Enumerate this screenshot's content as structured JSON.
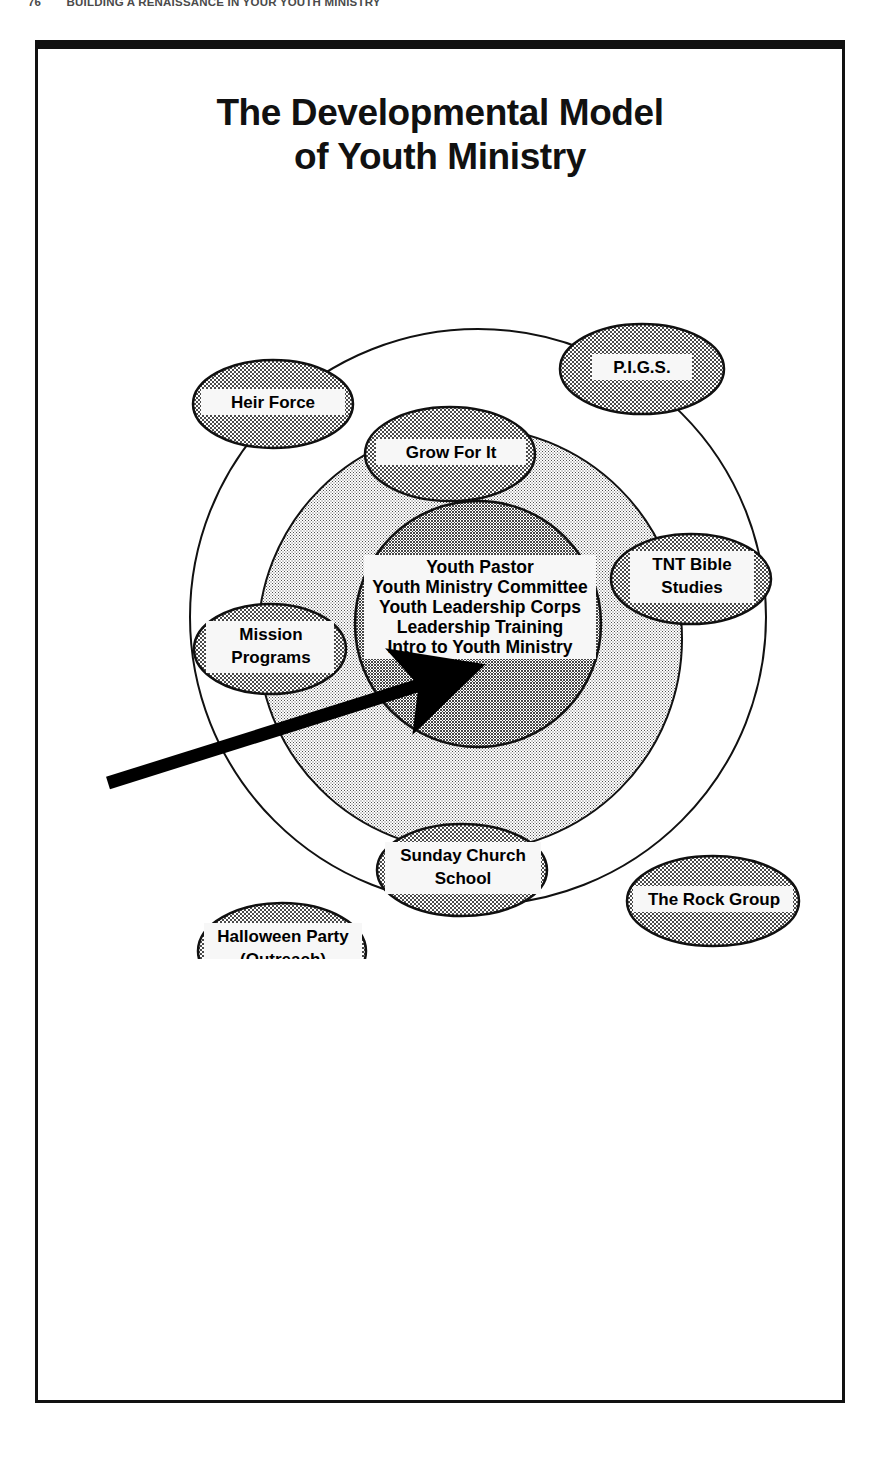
{
  "running_head": {
    "folio": "76",
    "text": "BUILDING A RENAISSANCE IN YOUR YOUTH MINISTRY"
  },
  "figure": {
    "title_line1": "The Developmental Model",
    "title_line2": "of Youth Ministry",
    "colors": {
      "ink": "#111111",
      "outer_ring_fill": "#ffffff",
      "middle_ring_fill": "#d4d4d4",
      "inner_core_fill": "#a8a8a8",
      "ellipse_fill": "#b3b3b3",
      "label_box_fill": "#f5f5f5"
    },
    "center_core": {
      "lines": [
        "Youth Pastor",
        "Youth Ministry Committee",
        "Youth Leadership Corps",
        "Leadership Training",
        "Intro to Youth Ministry"
      ]
    },
    "rings": [
      {
        "name": "outer-ring",
        "cx": 440,
        "cy": 418,
        "r": 288
      },
      {
        "name": "middle-ring",
        "cx": 432,
        "cy": 440,
        "r": 212
      },
      {
        "name": "inner-core",
        "cx": 440,
        "cy": 425,
        "r": 123
      }
    ],
    "ellipses": [
      {
        "id": "heir-force",
        "label_lines": [
          "Heir Force"
        ],
        "cx": 235,
        "cy": 205,
        "rx": 80,
        "ry": 44
      },
      {
        "id": "pigs",
        "label_lines": [
          "P.I.G.S."
        ],
        "cx": 604,
        "cy": 170,
        "rx": 82,
        "ry": 45
      },
      {
        "id": "grow-for-it",
        "label_lines": [
          "Grow For It"
        ],
        "cx": 412,
        "cy": 255,
        "rx": 85,
        "ry": 47
      },
      {
        "id": "tnt-bible-studies",
        "label_lines": [
          "TNT Bible",
          "Studies"
        ],
        "cx": 653,
        "cy": 380,
        "rx": 80,
        "ry": 45
      },
      {
        "id": "mission-programs",
        "label_lines": [
          "Mission",
          "Programs"
        ],
        "cx": 232,
        "cy": 450,
        "rx": 76,
        "ry": 45
      },
      {
        "id": "sunday-church-school",
        "label_lines": [
          "Sunday Church",
          "School"
        ],
        "cx": 424,
        "cy": 671,
        "rx": 85,
        "ry": 46
      },
      {
        "id": "the-rock-group",
        "label_lines": [
          "The Rock Group"
        ],
        "cx": 675,
        "cy": 702,
        "rx": 86,
        "ry": 45
      },
      {
        "id": "halloween-party",
        "label_lines": [
          "Halloween Party",
          "(Outreach)"
        ],
        "cx": 244,
        "cy": 752,
        "rx": 84,
        "ry": 48
      }
    ],
    "arrow": {
      "name": "pointer-arrow",
      "from_x": 70,
      "from_y": 584,
      "to_x": 405,
      "to_y": 478
    }
  }
}
